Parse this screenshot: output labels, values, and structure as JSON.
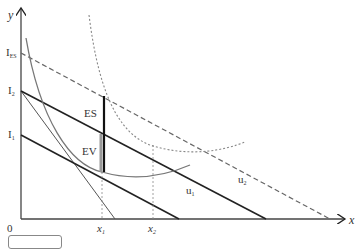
{
  "diagram": {
    "axes": {
      "y_label": "y",
      "x_label": "x",
      "origin_label": "0"
    },
    "y_ticks": [
      {
        "label": "I",
        "sub": "ES",
        "y": 53
      },
      {
        "label": "I",
        "sub": "2",
        "y": 91
      },
      {
        "label": "I",
        "sub": "1",
        "y": 135
      }
    ],
    "x_ticks": [
      {
        "label": "x",
        "sub": "1",
        "x": 102
      },
      {
        "label": "x",
        "sub": "2",
        "x": 153
      }
    ],
    "region_labels": {
      "es": "ES",
      "ev": "EV"
    },
    "curve_labels": {
      "u1": "u",
      "u1_sub": "1",
      "u2": "u",
      "u2_sub": "2"
    },
    "colors": {
      "line": "#222222",
      "curve": "#777777",
      "dashed": "#666666",
      "ev_bar": "#999999"
    }
  }
}
